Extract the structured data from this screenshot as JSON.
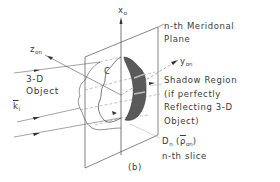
{
  "figure": {
    "caption": "(b)",
    "labels": {
      "x_axis": "x",
      "x_axis_sub": "o",
      "z_axis": "z",
      "z_axis_sub": "on",
      "y_axis": "y",
      "y_axis_sub": "on",
      "plane_line1": "n-th Meridonal",
      "plane_line2": "Plane",
      "object_line1": "3-D",
      "object_line2": "Object",
      "k_vector": "k",
      "k_vector_sub": "i",
      "contour": "C",
      "shadow_line1": "Shadow Region",
      "shadow_line2": "(if perfectly",
      "shadow_line3": "Reflecting 3-D",
      "shadow_line4": "Object)",
      "slice_symbol": "D",
      "slice_symbol_sub": "n",
      "slice_arg": "ρ",
      "slice_arg_sub": "on",
      "slice_line2": "n-th slice"
    },
    "colors": {
      "line": "#555555",
      "shadow_fill": "#5a5a5a",
      "text": "#3a3a3a"
    }
  }
}
